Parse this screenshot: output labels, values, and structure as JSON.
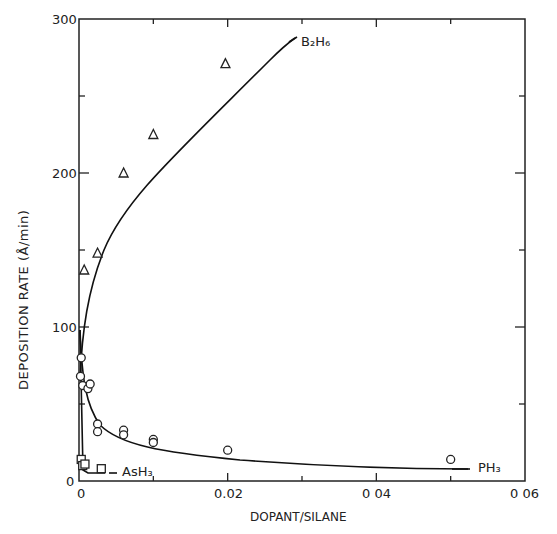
{
  "chart_data": {
    "type": "scatter",
    "title": "",
    "xlabel": "DOPANT/SILANE",
    "ylabel": "DEPOSITION RATE (Å/min)",
    "xlim": [
      0,
      0.06
    ],
    "ylim": [
      0,
      300
    ],
    "x_ticks": [
      "0",
      "0.02",
      "0.04",
      "0.06"
    ],
    "y_ticks": [
      "0",
      "100",
      "200",
      "300"
    ],
    "grid": false,
    "series": [
      {
        "name": "B2H6",
        "label_display": "B₂H₆",
        "marker": "triangle",
        "x": [
          0.0007,
          0.0025,
          0.006,
          0.01,
          0.0197
        ],
        "y": [
          137,
          148,
          200,
          225,
          271
        ]
      },
      {
        "name": "PH3",
        "label_display": "PH₃",
        "marker": "circle",
        "x": [
          0.0003,
          0.0002,
          0.0005,
          0.0012,
          0.0015,
          0.0025,
          0.0025,
          0.006,
          0.006,
          0.01,
          0.01,
          0.02,
          0.05
        ],
        "y": [
          80,
          68,
          62,
          60,
          63,
          37,
          32,
          33,
          30,
          27,
          25,
          20,
          14
        ]
      },
      {
        "name": "AsH3",
        "label_display": "AsH₃",
        "marker": "square",
        "x": [
          0.0003,
          0.0005,
          0.0008,
          0.003
        ],
        "y": [
          14,
          10,
          11,
          8
        ]
      }
    ]
  },
  "labels": {
    "xlabel": "DOPANT/SILANE",
    "ylabel": "DEPOSITION RATE  (Å/min)",
    "y300": "300",
    "y200": "200",
    "y100": "100",
    "y0": "0",
    "x0": "0",
    "x002": "0.02",
    "x004": "0 04",
    "x006": "0 06",
    "b2h6": "B₂H₆",
    "ph3": "PH₃",
    "ash3": "AsH₃"
  }
}
